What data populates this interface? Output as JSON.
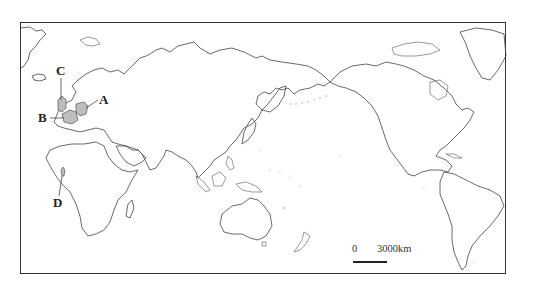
{
  "map": {
    "type": "world-outline-map",
    "projection_center": "Pacific-centered",
    "labels": [
      {
        "id": "A",
        "text": "A",
        "target": "Germany region (shaded)"
      },
      {
        "id": "B",
        "text": "B",
        "target": "France region (shaded)"
      },
      {
        "id": "C",
        "text": "C",
        "target": "Great Britain (shaded)"
      },
      {
        "id": "D",
        "text": "D",
        "target": "West Africa location (shaded)"
      }
    ],
    "scale": {
      "zero_label": "0",
      "distance_label": "3000km"
    },
    "colors": {
      "frame": "#333333",
      "coastline": "#444444",
      "shaded_region": "#bdbdbd",
      "background": "#ffffff"
    }
  }
}
